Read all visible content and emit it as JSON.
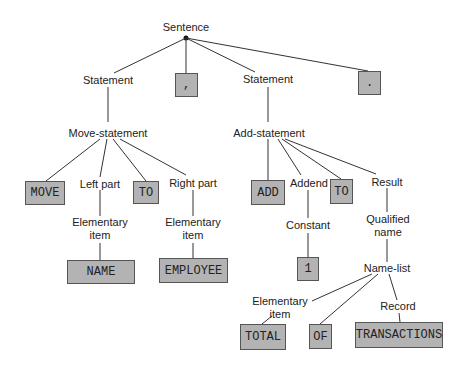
{
  "diagram": {
    "type": "parse-tree",
    "root": "Sentence",
    "nodes": {
      "sentence": "Sentence",
      "statement_1": "Statement",
      "comma": ",",
      "statement_2": "Statement",
      "period": ".",
      "move_statement": "Move-statement",
      "move": "MOVE",
      "left_part": "Left part",
      "to_1": "TO",
      "right_part": "Right part",
      "elem_item_1_a": "Elementary",
      "elem_item_1_b": "item",
      "elem_item_2_a": "Elementary",
      "elem_item_2_b": "item",
      "name": "NAME",
      "employee": "EMPLOYEE",
      "add_statement": "Add-statement",
      "add": "ADD",
      "addend": "Addend",
      "to_2": "TO",
      "result": "Result",
      "constant": "Constant",
      "one": "1",
      "qualified_name_a": "Qualified",
      "qualified_name_b": "name",
      "name_list": "Name-list",
      "elem_item_3_a": "Elementary",
      "elem_item_3_b": "item",
      "record": "Record",
      "total": "TOTAL",
      "of": "OF",
      "transactions": "TRANSACTIONS"
    },
    "edges": [
      [
        "Sentence",
        "Statement"
      ],
      [
        "Sentence",
        ","
      ],
      [
        "Sentence",
        "Statement"
      ],
      [
        "Sentence",
        "."
      ],
      [
        "Statement",
        "Move-statement"
      ],
      [
        "Move-statement",
        "MOVE"
      ],
      [
        "Move-statement",
        "Left part"
      ],
      [
        "Move-statement",
        "TO"
      ],
      [
        "Move-statement",
        "Right part"
      ],
      [
        "Left part",
        "Elementary item"
      ],
      [
        "Elementary item",
        "NAME"
      ],
      [
        "Right part",
        "Elementary item"
      ],
      [
        "Elementary item",
        "EMPLOYEE"
      ],
      [
        "Statement",
        "Add-statement"
      ],
      [
        "Add-statement",
        "ADD"
      ],
      [
        "Add-statement",
        "Addend"
      ],
      [
        "Add-statement",
        "TO"
      ],
      [
        "Add-statement",
        "Result"
      ],
      [
        "Addend",
        "Constant"
      ],
      [
        "Constant",
        "1"
      ],
      [
        "Result",
        "Qualified name"
      ],
      [
        "Qualified name",
        "Name-list"
      ],
      [
        "Name-list",
        "Elementary item"
      ],
      [
        "Name-list",
        "OF"
      ],
      [
        "Name-list",
        "Record"
      ],
      [
        "Elementary item",
        "TOTAL"
      ],
      [
        "Record",
        "TRANSACTIONS"
      ]
    ],
    "colors": {
      "terminal_fill": "#b3b3b3",
      "line": "#333333",
      "text": "#222222"
    }
  }
}
